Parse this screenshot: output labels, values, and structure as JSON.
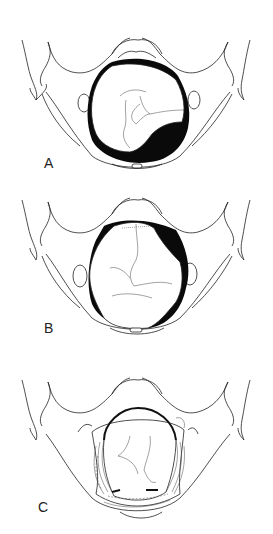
{
  "figure": {
    "panels": [
      {
        "id": "A",
        "label": "A",
        "description": "Pelvic inlet view with fetal head, large dark space posteriorly"
      },
      {
        "id": "B",
        "label": "B",
        "description": "Pelvic inlet view with fetal head rotated, dark spaces at oblique diameters"
      },
      {
        "id": "C",
        "label": "C",
        "description": "Pelvic floor view with levator ani muscles surrounding fetal head"
      }
    ]
  }
}
